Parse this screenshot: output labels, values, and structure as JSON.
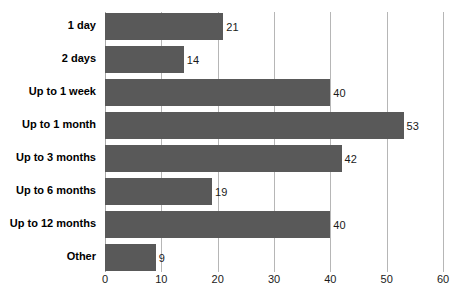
{
  "chart_data": {
    "type": "bar",
    "orientation": "horizontal",
    "title": "",
    "subtitle": "",
    "xlabel": "",
    "ylabel": "",
    "categories": [
      "1 day",
      "2 days",
      "Up to 1 week",
      "Up to 1 month",
      "Up to 3 months",
      "Up to 6 months",
      "Up to 12 months",
      "Other"
    ],
    "values": [
      21,
      14,
      40,
      53,
      42,
      19,
      40,
      9
    ],
    "data_labels": [
      "21",
      "14",
      "40",
      "53",
      "42",
      "19",
      "40",
      "9"
    ],
    "xlim": [
      0,
      60
    ],
    "xticks": [
      0,
      10,
      20,
      30,
      40,
      50,
      60
    ],
    "xtick_labels": [
      "0",
      "10",
      "20",
      "30",
      "40",
      "50",
      "60"
    ],
    "grid": "vertical",
    "legend": "none",
    "annotations": [],
    "colors": {
      "bar": "#595959",
      "gridline": "#b6b6b6",
      "axis": "#a8a8a8",
      "background": "#ffffff",
      "text": "#000000"
    }
  }
}
